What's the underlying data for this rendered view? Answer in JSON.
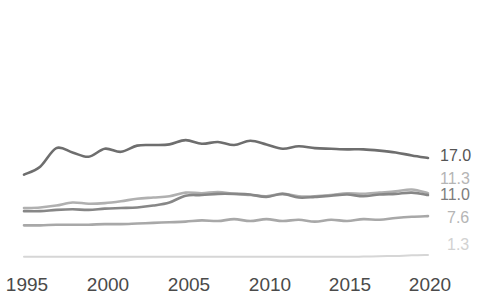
{
  "chart_data": {
    "type": "line",
    "title": "",
    "subtitle": "",
    "xlabel": "",
    "ylabel": "",
    "grid": false,
    "legend_position": "right-end-labels",
    "xlim": [
      1995,
      2020
    ],
    "ylim": [
      0,
      20
    ],
    "x_ticks": [
      "1995",
      "2000",
      "2005",
      "2010",
      "2015",
      "2020"
    ],
    "x": [
      1995,
      1996,
      1997,
      1998,
      1999,
      2000,
      2001,
      2002,
      2003,
      2004,
      2005,
      2006,
      2007,
      2008,
      2009,
      2010,
      2011,
      2012,
      2013,
      2014,
      2015,
      2016,
      2017,
      2018,
      2019,
      2020
    ],
    "series": [
      {
        "name": "series-1",
        "end_label": "17.0",
        "color": "#6e6e6e",
        "values": [
          14.3,
          15.6,
          18.6,
          17.9,
          17.2,
          18.5,
          18.0,
          19.0,
          19.1,
          19.2,
          19.9,
          19.3,
          19.6,
          19.1,
          19.8,
          19.2,
          18.5,
          18.9,
          18.6,
          18.5,
          18.4,
          18.4,
          18.2,
          17.9,
          17.4,
          17.0
        ]
      },
      {
        "name": "series-2",
        "end_label": "11.3",
        "color": "#b0b0b0",
        "values": [
          8.9,
          9.0,
          9.3,
          9.8,
          9.6,
          9.7,
          10.0,
          10.4,
          10.6,
          10.8,
          11.4,
          11.3,
          11.5,
          11.2,
          11.0,
          10.8,
          11.2,
          10.8,
          10.8,
          11.0,
          11.3,
          11.2,
          11.4,
          11.6,
          11.9,
          11.3
        ]
      },
      {
        "name": "series-3",
        "end_label": "11.0",
        "color": "#878787",
        "values": [
          8.4,
          8.4,
          8.6,
          8.7,
          8.6,
          8.8,
          8.9,
          9.0,
          9.3,
          9.8,
          10.9,
          11.0,
          11.2,
          11.2,
          11.1,
          10.7,
          11.2,
          10.6,
          10.7,
          10.9,
          11.1,
          10.8,
          11.1,
          11.2,
          11.4,
          11.0
        ]
      },
      {
        "name": "series-4",
        "end_label": "7.6",
        "color": "#a8a8a8",
        "values": [
          6.1,
          6.1,
          6.2,
          6.2,
          6.2,
          6.3,
          6.3,
          6.4,
          6.5,
          6.6,
          6.7,
          6.9,
          6.8,
          7.1,
          6.8,
          7.1,
          6.8,
          7.0,
          6.7,
          7.0,
          6.8,
          7.1,
          7.0,
          7.3,
          7.5,
          7.6
        ]
      },
      {
        "name": "series-5",
        "end_label": "1.3",
        "color": "#d6d6d6",
        "values": [
          1.0,
          1.0,
          1.0,
          1.0,
          1.0,
          1.0,
          1.0,
          1.0,
          1.0,
          1.0,
          1.0,
          1.0,
          1.0,
          1.0,
          1.0,
          1.0,
          1.0,
          1.0,
          1.0,
          1.0,
          1.0,
          1.05,
          1.1,
          1.15,
          1.25,
          1.3
        ]
      }
    ],
    "end_labels": [
      {
        "text": "17.0",
        "color": "#555555",
        "y": 157
      },
      {
        "text": "11.3",
        "color": "#b5b5b5",
        "y": 180
      },
      {
        "text": "11.0",
        "color": "#7d7d7d",
        "y": 196
      },
      {
        "text": "7.6",
        "color": "#b5b5b5",
        "y": 219
      },
      {
        "text": "1.3",
        "color": "#d2d2d2",
        "y": 246
      }
    ]
  }
}
